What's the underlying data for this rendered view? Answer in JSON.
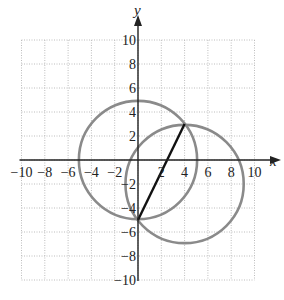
{
  "chart_data": {
    "type": "scatter",
    "title": "",
    "xlabel": "x",
    "ylabel": "y",
    "xlim": [
      -10,
      10
    ],
    "ylim": [
      -10,
      10
    ],
    "grid": true,
    "grid_step": 2,
    "x_ticks": [
      "-10",
      "-8",
      "-6",
      "-4",
      "-2",
      "2",
      "4",
      "6",
      "8",
      "10"
    ],
    "y_ticks": [
      "10",
      "8",
      "6",
      "4",
      "2",
      "-2",
      "-4",
      "-6",
      "-8",
      "-10"
    ],
    "shapes": [
      {
        "kind": "circle",
        "name": "circle-1",
        "center": [
          0,
          0
        ],
        "radius": 5,
        "color": "#8a8a8a"
      },
      {
        "kind": "circle",
        "name": "circle-2",
        "center": [
          4,
          -2
        ],
        "radius": 5,
        "color": "#8a8a8a"
      },
      {
        "kind": "segment",
        "name": "chord",
        "from": [
          0,
          -5
        ],
        "to": [
          4,
          3
        ],
        "color": "#111111"
      }
    ],
    "intersection_points": [
      [
        0,
        -5
      ],
      [
        4,
        3
      ]
    ]
  },
  "colors": {
    "grid": "#bdbdbd",
    "axis": "#222222",
    "circle": "#8a8a8a",
    "segment": "#111111"
  }
}
